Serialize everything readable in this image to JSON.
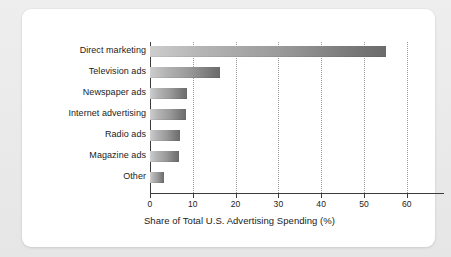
{
  "chart_data": {
    "type": "bar",
    "orientation": "horizontal",
    "title": "",
    "xlabel": "Share of Total U.S. Advertising Spending (%)",
    "ylabel": "",
    "categories": [
      "Direct marketing",
      "Television ads",
      "Newspaper ads",
      "Internet advertising",
      "Radio ads",
      "Magazine ads",
      "Other"
    ],
    "values": [
      53.5,
      15.8,
      8.4,
      8.2,
      6.8,
      6.5,
      3.2
    ],
    "xlim": [
      0,
      68
    ],
    "xticks": [
      0,
      10,
      20,
      30,
      40,
      50,
      60
    ],
    "xtick_labels": [
      "0",
      "10",
      "20",
      "30",
      "40",
      "50",
      "60"
    ],
    "grid": "vertical-dotted",
    "legend": "none",
    "bar_color_start": "#cdcdcd",
    "bar_color_end": "#6b6b6b",
    "axis_color": "#3b3b3b",
    "gridline_color": "#9a9a9a",
    "panel_background": "#ffffff",
    "figure_background": "#e8e8e8"
  }
}
